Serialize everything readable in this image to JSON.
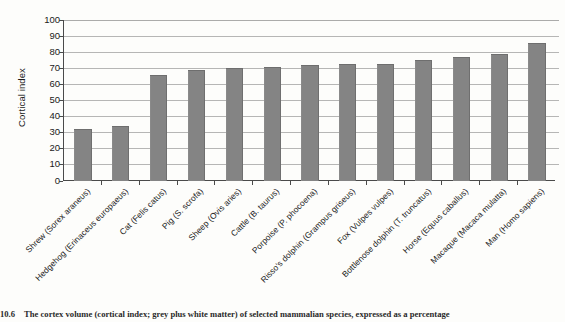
{
  "chart_data": {
    "type": "bar",
    "title": "",
    "xlabel": "",
    "ylabel": "Cortical index",
    "ylim": [
      0,
      100
    ],
    "ytick_step": 10,
    "yticks": [
      100,
      90,
      80,
      70,
      60,
      50,
      40,
      30,
      20,
      10,
      0
    ],
    "grid": true,
    "legend": false,
    "bar_color": "#848484",
    "categories": [
      "Shrew (Sorex araneus)",
      "Hedgehog (Erinaceus europaeus)",
      "Cat (Felis catus)",
      "Pig (S. scrofa)",
      "Sheep (Ovis aries)",
      "Cattle (B. taurus)",
      "Porpoise (P. phocoena)",
      "Risso's dolphin (Grampus griseus)",
      "Fox (Vulpes vulpes)",
      "Bottlenose dolphin (T. truncatus)",
      "Horse (Equus caballus)",
      "Macaque (Macaca mulatta)",
      "Man (Homo sapiens)"
    ],
    "values": [
      31.5,
      33,
      65,
      68,
      69,
      70,
      71,
      71.5,
      72,
      74,
      76,
      78,
      85
    ]
  },
  "caption": {
    "number": "10.6",
    "text": "The cortex volume (cortical index; grey plus white matter) of selected mammalian species, expressed as a percentage"
  }
}
